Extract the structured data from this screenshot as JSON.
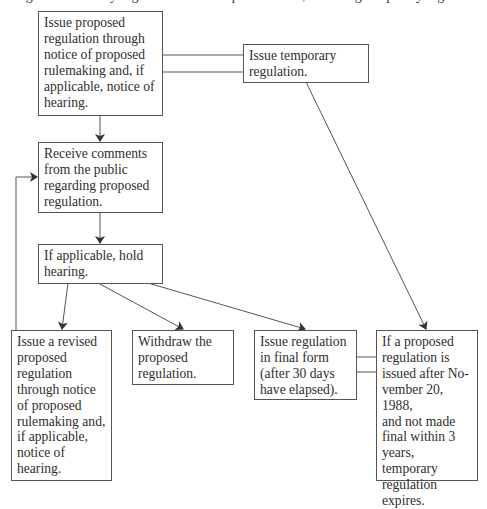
{
  "caption": "Figure 1. Treasury regulation issuance process flow, including temporary regulations",
  "colors": {
    "line": "#555555",
    "text": "#2e2e2e",
    "background": "#ffffff"
  },
  "boxes": {
    "issue_proposed": "Issue proposed\nregulation through\nnotice of proposed\nrulemaking and, if\napplicable, notice of\nhearing.",
    "issue_temporary": "Issue temporary\nregulation.",
    "receive_comments": "Receive comments\nfrom the public\nregarding proposed\nregulation.",
    "hold_hearing": "If applicable, hold\nhearing.",
    "issue_revised": "Issue a revised\nproposed\nregulation\nthrough notice\nof proposed\nrulemaking and,\nif applicable,\nnotice of\nhearing.",
    "withdraw": "Withdraw the\nproposed\nregulation.",
    "issue_final": "Issue regulation\nin final form\n(after 30 days\nhave elapsed).",
    "temporary_expires": "If a proposed\nregulation is\nissued after No-\nvember 20, 1988,\nand not made\nfinal within 3\nyears, temporary\nregulation\nexpires."
  },
  "edges": [
    {
      "from": "issue_proposed",
      "to": "issue_temporary",
      "type": "double-line"
    },
    {
      "from": "issue_proposed",
      "to": "receive_comments",
      "type": "arrow"
    },
    {
      "from": "receive_comments",
      "to": "hold_hearing",
      "type": "arrow"
    },
    {
      "from": "hold_hearing",
      "to": "issue_revised",
      "type": "arrow"
    },
    {
      "from": "hold_hearing",
      "to": "withdraw",
      "type": "arrow"
    },
    {
      "from": "hold_hearing",
      "to": "issue_final",
      "type": "arrow"
    },
    {
      "from": "issue_revised",
      "to": "receive_comments",
      "type": "arrow-loop"
    },
    {
      "from": "issue_temporary",
      "to": "temporary_expires",
      "type": "arrow"
    },
    {
      "from": "issue_final",
      "to": "temporary_expires",
      "type": "double-line"
    }
  ]
}
